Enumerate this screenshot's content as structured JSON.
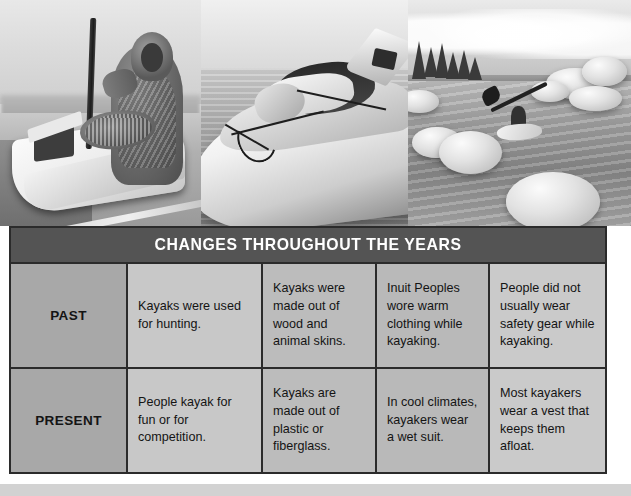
{
  "photos": [
    {
      "name": "historic-inuit-hunter-kayak",
      "caption": "Black and white photograph of an Inuit hunter in fur clothing standing beside a skin kayak holding a pole",
      "tone": "grayscale"
    },
    {
      "name": "modern-sea-kayak-closeup",
      "caption": "Close-up photograph of a modern white sea kayak with deck rigging on calm water",
      "tone": "grayscale"
    },
    {
      "name": "kayaker-among-boulders",
      "caption": "Photograph of a kayaker paddling through clear shallow water among large rounded boulders with pine trees on the shore",
      "tone": "grayscale"
    }
  ],
  "table": {
    "banner_title": "CHANGES THROUGHOUT THE YEARS",
    "rows": [
      {
        "label": "PAST",
        "cells": [
          "Kayaks were used for hunting.",
          "Kayaks were made out of wood and animal skins.",
          "Inuit Peoples wore warm clothing while kayaking.",
          "People did not usually wear safety gear while kayaking."
        ]
      },
      {
        "label": "PRESENT",
        "cells": [
          "People kayak for fun or for competition.",
          "Kayaks are made out of plastic or fiberglass.",
          "In cool climates, kayakers wear a wet suit.",
          "Most kayakers wear a vest that keeps them afloat."
        ]
      }
    ]
  },
  "colors": {
    "banner_background": "#545454",
    "banner_text": "#ffffff",
    "table_border": "#2b2b2b",
    "label_cell_background": "#a8a8a8",
    "cell_background_light": "#cacaca",
    "cell_background_mid": "#bcbcbc",
    "page_background": "#ffffff",
    "footer_band": "#d2d2d2"
  }
}
